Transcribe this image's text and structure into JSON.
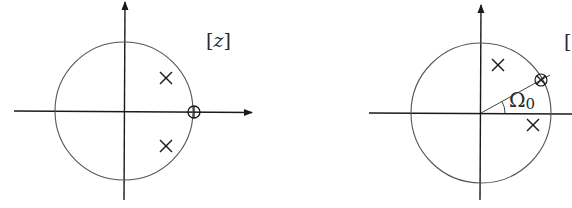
{
  "figure": {
    "colors": {
      "stroke": "#2a2a2a",
      "circle": "#555555",
      "background": "#ffffff"
    }
  },
  "plots": [
    {
      "name": "left-z-plane",
      "label_open": "[",
      "label_var": "z",
      "label_close": "]",
      "unit_circle": true,
      "poles": [
        "upper-right inside circle",
        "lower-right inside circle"
      ],
      "zeros": [
        "z = 1 on real axis"
      ]
    },
    {
      "name": "right-z-plane",
      "label_open": "[",
      "angle_symbol": "Ω",
      "angle_subscript": "0",
      "unit_circle": true,
      "poles": [
        "upper, near imaginary axis",
        "lower-right, just below real axis"
      ],
      "zeros": [
        "on unit circle at angle Ω0"
      ]
    }
  ]
}
